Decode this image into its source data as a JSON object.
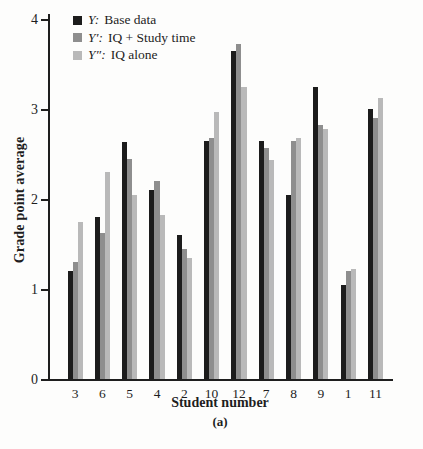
{
  "colors": {
    "base": "#1c1c1c",
    "iq_study": "#8e8e8e",
    "iq_alone": "#b9b9b9",
    "axis": "#1e1e1e",
    "background": "#fdfdfc"
  },
  "legend": [
    {
      "symbol": "Y:",
      "label": "Base data"
    },
    {
      "symbol": "Y′:",
      "label": "IQ + Study time"
    },
    {
      "symbol": "Y″:",
      "label": "IQ alone"
    }
  ],
  "chart_data": {
    "type": "bar",
    "title": "",
    "xlabel": "Student number",
    "ylabel": "Grade point average",
    "sublabel": "(a)",
    "ylim": [
      0,
      4
    ],
    "yticks": [
      "0",
      "1",
      "2",
      "3",
      "4"
    ],
    "grid": false,
    "legend_position": "top-left",
    "categories": [
      "3",
      "6",
      "5",
      "4",
      "2",
      "10",
      "12",
      "7",
      "8",
      "9",
      "1",
      "11"
    ],
    "series": [
      {
        "name": "Y: Base data",
        "color_key": "base",
        "values": [
          1.2,
          1.8,
          2.63,
          2.1,
          1.6,
          2.65,
          3.65,
          2.65,
          2.05,
          3.25,
          1.05,
          3.0
        ]
      },
      {
        "name": "Y′: IQ + Study time",
        "color_key": "iq_study",
        "values": [
          1.3,
          1.62,
          2.45,
          2.2,
          1.45,
          2.68,
          3.72,
          2.57,
          2.65,
          2.82,
          1.2,
          2.9
        ]
      },
      {
        "name": "Y″: IQ alone",
        "color_key": "iq_alone",
        "values": [
          1.75,
          2.3,
          2.05,
          1.82,
          1.35,
          2.97,
          3.25,
          2.43,
          2.68,
          2.78,
          1.22,
          3.12
        ]
      }
    ]
  }
}
